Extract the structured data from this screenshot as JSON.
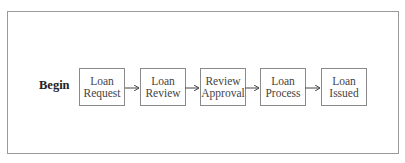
{
  "diagram": {
    "start_label": "Begin",
    "nodes": [
      {
        "line1": "Loan",
        "line2": "Request"
      },
      {
        "line1": "Loan",
        "line2": "Review"
      },
      {
        "line1": "Review",
        "line2": "Approval"
      },
      {
        "line1": "Loan",
        "line2": "Process"
      },
      {
        "line1": "Loan",
        "line2": "Issued"
      }
    ],
    "edges": [
      {
        "from": "Loan Request",
        "to": "Loan Review"
      },
      {
        "from": "Loan Review",
        "to": "Review Approval"
      },
      {
        "from": "Review Approval",
        "to": "Loan Process"
      },
      {
        "from": "Loan Process",
        "to": "Loan Issued"
      }
    ],
    "colors": {
      "border": "#8a8a8a",
      "arrow": "#444444",
      "frame": "#9a9a9a"
    }
  }
}
